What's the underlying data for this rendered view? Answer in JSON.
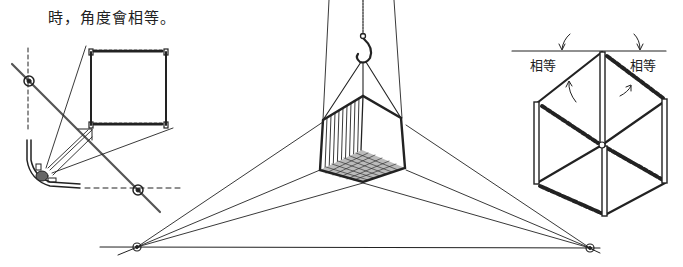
{
  "caption": {
    "text": "時，角度會相等。"
  },
  "figures": {
    "left": {
      "description": "observer viewing square frame along diagonal",
      "icons": [
        "observer-figure-icon",
        "eye-point-icon"
      ]
    },
    "center": {
      "description": "hanging crate from hook in three-point perspective",
      "icons": [
        "hook-icon",
        "chain-icon",
        "crate-icon",
        "vanishing-point-icon"
      ]
    },
    "right": {
      "labels": {
        "left_angle": "相等",
        "right_angle": "相等"
      },
      "description": "cube frame with equal angles to horizon"
    }
  },
  "colors": {
    "ink": "#222222",
    "background": "#ffffff"
  }
}
